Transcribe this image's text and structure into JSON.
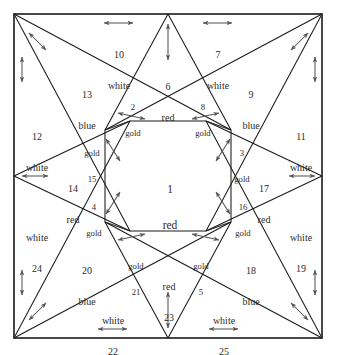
{
  "figure": {
    "border_color": "#1a1a1a",
    "line_color": "#1a1a1a",
    "arrow_color": "#555555",
    "background": "#ffffff"
  },
  "legend_colors": {
    "red": "red",
    "white": "white",
    "blue": "blue",
    "gold": "gold"
  },
  "pieces": [
    {
      "id": "p1",
      "number": "1",
      "color": "red",
      "order": "number-first"
    },
    {
      "id": "p2",
      "number": "2",
      "color": "gold",
      "order": "number-first"
    },
    {
      "id": "p3",
      "number": "3",
      "color": "gold",
      "order": "number-first"
    },
    {
      "id": "p4",
      "number": "4",
      "color": "gold",
      "order": "number-first"
    },
    {
      "id": "p5",
      "number": "5",
      "color": "gold",
      "order": "color-first"
    },
    {
      "id": "p6",
      "number": "6",
      "color": "red",
      "order": "number-first"
    },
    {
      "id": "p7",
      "number": "7",
      "color": "white",
      "order": "number-first"
    },
    {
      "id": "p8",
      "number": "8",
      "color": "gold",
      "order": "number-first"
    },
    {
      "id": "p9",
      "number": "9",
      "color": "blue",
      "order": "number-first"
    },
    {
      "id": "p10",
      "number": "10",
      "color": "white",
      "order": "number-first"
    },
    {
      "id": "p11",
      "number": "11",
      "color": "white",
      "order": "number-first"
    },
    {
      "id": "p12",
      "number": "12",
      "color": "white",
      "order": "number-first"
    },
    {
      "id": "p13",
      "number": "13",
      "color": "blue",
      "order": "number-first"
    },
    {
      "id": "p14",
      "number": "14",
      "color": "red",
      "order": "number-first"
    },
    {
      "id": "p15",
      "number": "15",
      "color": "gold",
      "order": "color-first"
    },
    {
      "id": "p16",
      "number": "16",
      "color": "gold",
      "order": "number-first"
    },
    {
      "id": "p17",
      "number": "17",
      "color": "red",
      "order": "number-first"
    },
    {
      "id": "p18",
      "number": "18",
      "color": "blue",
      "order": "number-first"
    },
    {
      "id": "p19",
      "number": "19",
      "color": "white",
      "order": "color-first"
    },
    {
      "id": "p20",
      "number": "20",
      "color": "blue",
      "order": "number-first"
    },
    {
      "id": "p21",
      "number": "21",
      "color": "gold",
      "order": "color-first"
    },
    {
      "id": "p22",
      "number": "22",
      "color": "white",
      "order": "color-first"
    },
    {
      "id": "p23",
      "number": "23",
      "color": "red",
      "order": "color-first"
    },
    {
      "id": "p24",
      "number": "24",
      "color": "white",
      "order": "color-first"
    },
    {
      "id": "p25",
      "number": "25",
      "color": "white",
      "order": "color-first"
    }
  ]
}
